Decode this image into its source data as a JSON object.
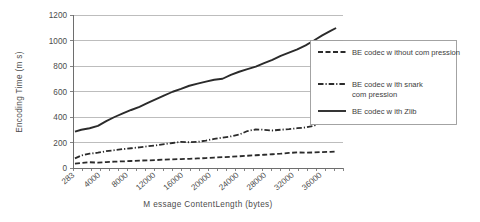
{
  "chart_data": {
    "type": "line",
    "title": "",
    "xlabel": "M essage ContentLength (bytes)",
    "ylabel": "Encoding Time (m s)",
    "grid": true,
    "legend_position": "top-right-inside",
    "ylim": [
      0,
      1200
    ],
    "yticks": [
      "0",
      "200",
      "400",
      "600",
      "800",
      "1000",
      "1200"
    ],
    "ytick_values": [
      0,
      200,
      400,
      600,
      800,
      1000,
      1200
    ],
    "categories": [
      "283",
      "4000",
      "8000",
      "12000",
      "16000",
      "20000",
      "24000",
      "28000",
      "32000",
      "36000"
    ],
    "x": [
      283,
      4000,
      8000,
      12000,
      16000,
      20000,
      24000,
      28000,
      32000,
      36000
    ],
    "xlim": [
      0,
      39000
    ],
    "series": [
      {
        "name": "BE codec w ithout com pression",
        "style": "dashed",
        "color": "#2b2b2b",
        "x": [
          283,
          1200,
          2400,
          3600,
          4800,
          6000,
          7200,
          8400,
          9600,
          10800,
          12000,
          13200,
          14400,
          15600,
          16800,
          18000,
          19200,
          20400,
          21600,
          22800,
          24000,
          25200,
          26400,
          27600,
          28800,
          30000,
          31200,
          32400,
          33600,
          34800,
          36000,
          37200,
          38000
        ],
        "values": [
          35,
          40,
          45,
          42,
          46,
          50,
          52,
          55,
          58,
          60,
          62,
          66,
          68,
          70,
          72,
          75,
          78,
          82,
          85,
          88,
          92,
          96,
          100,
          104,
          108,
          112,
          118,
          122,
          120,
          122,
          125,
          127,
          130
        ]
      },
      {
        "name": "BE codec w ith snark com pression",
        "style": "dash-dot",
        "color": "#2b2b2b",
        "x": [
          283,
          1200,
          2400,
          3600,
          4800,
          6000,
          7200,
          8400,
          9600,
          10800,
          12000,
          13200,
          14400,
          15600,
          16800,
          18000,
          19200,
          20400,
          21600,
          22800,
          24000,
          25200,
          26400,
          27600,
          28800,
          30000,
          31200,
          32400,
          33600,
          34800,
          36000
        ],
        "values": [
          75,
          98,
          112,
          120,
          132,
          140,
          148,
          155,
          162,
          170,
          178,
          188,
          196,
          205,
          202,
          205,
          215,
          228,
          238,
          248,
          262,
          290,
          302,
          300,
          294,
          300,
          305,
          312,
          318,
          330,
          370
        ]
      },
      {
        "name": "BE codec w ith Zlib",
        "style": "solid",
        "color": "#4f4f4f",
        "x": [
          283,
          1200,
          2400,
          3600,
          4800,
          6000,
          7200,
          8400,
          9600,
          10800,
          12000,
          13200,
          14400,
          15600,
          16800,
          18000,
          19200,
          20400,
          21600,
          22800,
          24000,
          25200,
          26400,
          27600,
          28800,
          30000,
          31200,
          32400,
          33600,
          34800,
          36000,
          37200,
          38000
        ],
        "values": [
          285,
          300,
          312,
          330,
          368,
          400,
          428,
          455,
          480,
          510,
          540,
          570,
          598,
          620,
          645,
          662,
          678,
          692,
          700,
          730,
          755,
          775,
          795,
          822,
          848,
          880,
          905,
          930,
          962,
          1000,
          1040,
          1075,
          1098
        ]
      }
    ]
  },
  "legend": {
    "entries": [
      {
        "label_line1": "BE codec w ithout com pression",
        "label_line2": ""
      },
      {
        "label_line1": "BE codec w ith snark",
        "label_line2": "com pression"
      },
      {
        "label_line1": "BE codec w ith Zlib",
        "label_line2": ""
      }
    ]
  },
  "colors": {
    "background": "#ffffff",
    "gridline": "#b2b2b2",
    "axis": "#6e6e6e",
    "series_dark": "#2b2b2b",
    "series_solid": "#4f4f4f",
    "text": "#4c4c4c"
  }
}
